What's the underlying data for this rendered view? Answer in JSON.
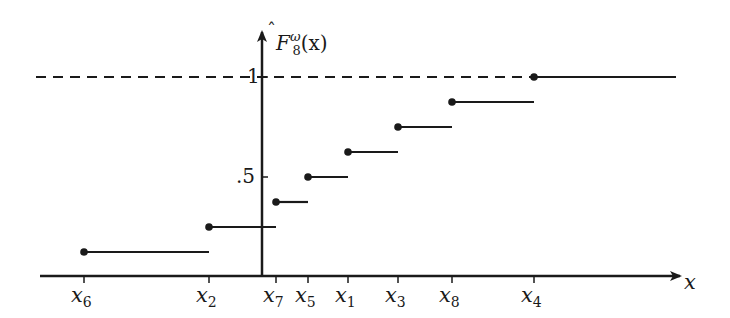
{
  "chart_data": {
    "type": "line",
    "subtype": "step (empirical distribution function)",
    "title_parts": {
      "base": "F",
      "superscript": "ω",
      "subscript": "8",
      "arg": "(x)",
      "hat": true
    },
    "xlabel": "x",
    "ylabel": "F̂₈^ω(x)",
    "x_tick_labels": [
      "x6",
      "x2",
      "x7",
      "x5",
      "x1",
      "x3",
      "x8",
      "x4"
    ],
    "x_tick_label_parts": [
      {
        "base": "x",
        "sub": "6"
      },
      {
        "base": "x",
        "sub": "2"
      },
      {
        "base": "x",
        "sub": "7"
      },
      {
        "base": "x",
        "sub": "5"
      },
      {
        "base": "x",
        "sub": "1"
      },
      {
        "base": "x",
        "sub": "3"
      },
      {
        "base": "x",
        "sub": "8"
      },
      {
        "base": "x",
        "sub": "4"
      }
    ],
    "y_tick_labels": [
      ".5",
      "1"
    ],
    "y_ticks": [
      0.5,
      1
    ],
    "ylim": [
      0,
      1.05
    ],
    "grid": false,
    "legend": null,
    "reference_line": {
      "y": 1,
      "style": "dashed",
      "extends": "left of x4"
    },
    "steps": [
      {
        "from": "x6",
        "to": "x2",
        "value": 0.125
      },
      {
        "from": "x2",
        "to": "x7",
        "value": 0.25
      },
      {
        "from": "x7",
        "to": "x5",
        "value": 0.375
      },
      {
        "from": "x5",
        "to": "x1",
        "value": 0.5
      },
      {
        "from": "x1",
        "to": "x3",
        "value": 0.625
      },
      {
        "from": "x3",
        "to": "x8",
        "value": 0.75
      },
      {
        "from": "x8",
        "to": "x4",
        "value": 0.875
      },
      {
        "from": "x4",
        "to": "+inf",
        "value": 1.0
      }
    ],
    "series": [
      {
        "name": "F̂₈^ω(x)",
        "x": [
          "x6",
          "x2",
          "x7",
          "x5",
          "x1",
          "x3",
          "x8",
          "x4"
        ],
        "values": [
          0.125,
          0.25,
          0.375,
          0.5,
          0.625,
          0.75,
          0.875,
          1.0
        ]
      }
    ],
    "colors": {
      "line": "#1a1a1a",
      "background": "#ffffff"
    }
  },
  "layout": {
    "x_axis_y": 276,
    "y_axis_x": 262,
    "y_zero_px": 277,
    "px_per_unit": 200,
    "x_positions": [
      84,
      209,
      276,
      308,
      348,
      398,
      452,
      534
    ],
    "x_end": 676
  }
}
